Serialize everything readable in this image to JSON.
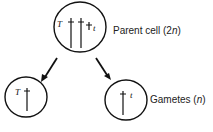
{
  "parent": {
    "label": "Parent cell (2",
    "ploidy": "n",
    "close": ")",
    "alleles": [
      "T",
      "t"
    ]
  },
  "gametes": {
    "label": "Gametes (",
    "ploidy": "n",
    "close": ")",
    "left_allele": "T",
    "right_allele": "t"
  }
}
